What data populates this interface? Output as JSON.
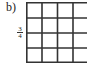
{
  "problem": {
    "label": "b)",
    "fraction": {
      "numerator": "3",
      "denominator": "4"
    }
  },
  "grid": {
    "rows": 4,
    "columns": 4,
    "line_color": "#333333",
    "fill": "#ffffff"
  }
}
